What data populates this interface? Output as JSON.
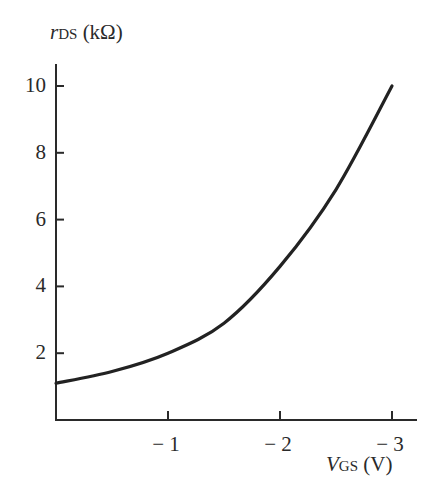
{
  "chart_data": {
    "type": "line",
    "title": "",
    "xlabel": "V_GS (V)",
    "ylabel": "r_DS (kΩ)",
    "x": [
      0,
      -0.5,
      -1,
      -1.5,
      -2,
      -2.5,
      -3
    ],
    "series": [
      {
        "name": "r_DS",
        "values": [
          1.1,
          1.45,
          2.0,
          2.9,
          4.6,
          6.9,
          10.0
        ]
      }
    ],
    "xticks": [
      "− 1",
      "− 2",
      "− 3"
    ],
    "xtick_values": [
      -1,
      -2,
      -3
    ],
    "yticks": [
      "2",
      "4",
      "6",
      "8",
      "10"
    ],
    "ytick_values": [
      2,
      4,
      6,
      8,
      10
    ],
    "xlim": [
      0,
      -3.2
    ],
    "ylim": [
      0,
      10.6
    ],
    "grid": false,
    "legend": "none"
  },
  "labels": {
    "y_axis_main": "r",
    "y_axis_sub": "DS",
    "y_axis_unit": "(kΩ)",
    "x_axis_main": "V",
    "x_axis_sub": "GS",
    "x_axis_unit": "(V)"
  }
}
